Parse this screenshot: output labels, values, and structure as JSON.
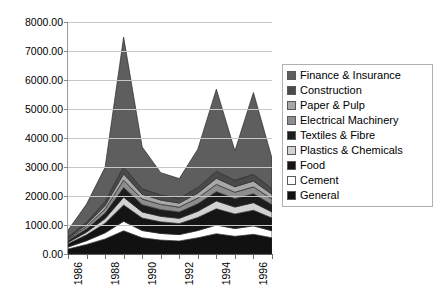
{
  "chart_data": {
    "type": "area",
    "stacked": true,
    "title": "",
    "xlabel": "",
    "ylabel": "",
    "ylim": [
      0,
      8000
    ],
    "ytick_labels": [
      "0.00",
      "1000.00",
      "2000.00",
      "3000.00",
      "4000.00",
      "5000.00",
      "6000.00",
      "7000.00",
      "8000.00"
    ],
    "ytick_values": [
      0,
      1000,
      2000,
      3000,
      4000,
      5000,
      6000,
      7000,
      8000
    ],
    "grid": true,
    "legend_position": "right",
    "x": [
      1986,
      1987,
      1988,
      1989,
      1990,
      1991,
      1992,
      1993,
      1994,
      1995,
      1996,
      1997
    ],
    "xtick_labels": [
      "1986",
      "",
      "1988",
      "",
      "1990",
      "",
      "1992",
      "",
      "1994",
      "",
      "1996",
      ""
    ],
    "xtick_labels_shown": [
      "1986",
      "1988",
      "1990",
      "1992",
      "1994",
      "1996"
    ],
    "series": [
      {
        "name": "General",
        "color": "#111111",
        "values": [
          170,
          330,
          520,
          800,
          560,
          480,
          450,
          560,
          700,
          610,
          680,
          560
        ]
      },
      {
        "name": "Cement",
        "color": "#ffffff",
        "values": [
          70,
          130,
          210,
          330,
          250,
          230,
          220,
          250,
          300,
          270,
          290,
          240
        ]
      },
      {
        "name": "Food",
        "color": "#141414",
        "values": [
          110,
          200,
          330,
          560,
          430,
          400,
          380,
          450,
          560,
          500,
          540,
          440
        ]
      },
      {
        "name": "Plastics & Chemicals",
        "color": "#d2d2d2",
        "values": [
          50,
          95,
          160,
          270,
          210,
          190,
          180,
          215,
          270,
          240,
          260,
          210
        ]
      },
      {
        "name": "Textiles & Fibre",
        "color": "#1c1c1c",
        "values": [
          60,
          110,
          185,
          330,
          250,
          230,
          215,
          255,
          320,
          285,
          305,
          250
        ]
      },
      {
        "name": "Electrical Machinery",
        "color": "#8d8d8d",
        "values": [
          45,
          85,
          145,
          255,
          195,
          180,
          170,
          200,
          250,
          225,
          240,
          195
        ]
      },
      {
        "name": "Paper & Pulp",
        "color": "#a8a8a8",
        "values": [
          35,
          70,
          120,
          215,
          165,
          150,
          140,
          170,
          210,
          190,
          200,
          165
        ]
      },
      {
        "name": "Construction",
        "color": "#4a4a4a",
        "values": [
          40,
          80,
          140,
          250,
          190,
          175,
          165,
          195,
          245,
          220,
          235,
          190
        ]
      },
      {
        "name": "Finance & Insurance",
        "color": "#5e5e5e",
        "values": [
          240,
          620,
          1180,
          4470,
          1440,
          770,
          680,
          1320,
          2830,
          1020,
          2820,
          1050
        ]
      }
    ],
    "totals": [
      820,
      1720,
      2990,
      7480,
      3690,
      2805,
      2600,
      3615,
      5685,
      3560,
      5570,
      3300
    ]
  },
  "legend": {
    "items": [
      {
        "label": "Finance & Insurance",
        "color": "#5e5e5e"
      },
      {
        "label": "Construction",
        "color": "#4a4a4a"
      },
      {
        "label": "Paper & Pulp",
        "color": "#a8a8a8"
      },
      {
        "label": "Electrical Machinery",
        "color": "#8d8d8d"
      },
      {
        "label": "Textiles & Fibre",
        "color": "#1c1c1c"
      },
      {
        "label": "Plastics & Chemicals",
        "color": "#d2d2d2"
      },
      {
        "label": "Food",
        "color": "#141414"
      },
      {
        "label": "Cement",
        "color": "#ffffff"
      },
      {
        "label": "General",
        "color": "#111111"
      }
    ]
  }
}
